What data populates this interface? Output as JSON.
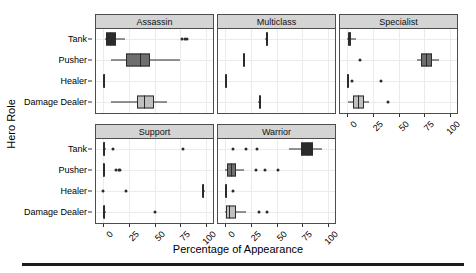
{
  "chart_data": {
    "type": "box",
    "title": "",
    "xlabel": "Percentage of Appearance",
    "ylabel": "Hero Role",
    "xlim": [
      -4,
      104
    ],
    "xticks": [
      0,
      25,
      50,
      75,
      100
    ],
    "xtick_labels": [
      "0",
      "25",
      "50",
      "75",
      "100"
    ],
    "categories": [
      "Tank",
      "Pusher",
      "Healer",
      "Damage Dealer"
    ],
    "grid": true,
    "legend": "none",
    "facet_variable": "Hero Class",
    "box_fill_colors": {
      "Tank": "#2b2b2b",
      "Pusher": "#6e6e6e",
      "Healer": "#2b2b2b",
      "Damage Dealer": "#c0c0c0"
    },
    "panels": [
      {
        "label": "Assassin",
        "row": 0,
        "col": 0,
        "boxes": [
          {
            "category": "Tank",
            "whisker_low": 1.5,
            "q1": 3.0,
            "median": 6.5,
            "q3": 12.5,
            "whisker_high": 21.0,
            "outliers": [
              77.0,
              79.5,
              81.5
            ]
          },
          {
            "category": "Pusher",
            "whisker_low": 8.0,
            "q1": 22.0,
            "median": 35.5,
            "q3": 46.0,
            "whisker_high": 75.0,
            "outliers": []
          },
          {
            "category": "Healer",
            "whisker_low": 0.0,
            "q1": 0.0,
            "median": 0.5,
            "q3": 1.0,
            "whisker_high": 1.5,
            "outliers": []
          },
          {
            "category": "Damage Dealer",
            "whisker_low": 8.0,
            "q1": 33.0,
            "median": 40.0,
            "q3": 49.5,
            "whisker_high": 62.0,
            "outliers": []
          }
        ]
      },
      {
        "label": "Multiclass",
        "row": 0,
        "col": 1,
        "boxes": [
          {
            "category": "Tank",
            "whisker_low": 39.0,
            "q1": 39.5,
            "median": 40.0,
            "q3": 40.5,
            "whisker_high": 41.0,
            "outliers": []
          },
          {
            "category": "Pusher",
            "whisker_low": 17.0,
            "q1": 17.5,
            "median": 18.0,
            "q3": 18.5,
            "whisker_high": 19.0,
            "outliers": []
          },
          {
            "category": "Healer",
            "whisker_low": 0.0,
            "q1": 0.0,
            "median": 0.5,
            "q3": 1.0,
            "whisker_high": 1.5,
            "outliers": []
          },
          {
            "category": "Damage Dealer",
            "whisker_low": 32.0,
            "q1": 32.5,
            "median": 33.0,
            "q3": 33.5,
            "whisker_high": 34.0,
            "outliers": []
          }
        ]
      },
      {
        "label": "Specialist",
        "row": 0,
        "col": 2,
        "boxes": [
          {
            "category": "Tank",
            "whisker_low": 0.0,
            "q1": 0.5,
            "median": 2.0,
            "q3": 4.0,
            "whisker_high": 8.5,
            "outliers": []
          },
          {
            "category": "Pusher",
            "whisker_low": 68.0,
            "q1": 72.0,
            "median": 77.0,
            "q3": 83.0,
            "whisker_high": 89.0,
            "outliers": [
              13.0
            ]
          },
          {
            "category": "Healer",
            "whisker_low": 0.0,
            "q1": 0.0,
            "median": 0.3,
            "q3": 0.6,
            "whisker_high": 1.0,
            "outliers": [
              5.0,
              33.0
            ]
          },
          {
            "category": "Damage Dealer",
            "whisker_low": 1.0,
            "q1": 5.5,
            "median": 11.0,
            "q3": 16.5,
            "whisker_high": 21.5,
            "outliers": [
              40.0
            ]
          }
        ]
      },
      {
        "label": "Support",
        "row": 1,
        "col": 0,
        "boxes": [
          {
            "category": "Tank",
            "whisker_low": 0.0,
            "q1": 0.0,
            "median": 0.5,
            "q3": 1.5,
            "whisker_high": 2.5,
            "outliers": [
              10.0,
              78.0
            ]
          },
          {
            "category": "Pusher",
            "whisker_low": 0.0,
            "q1": 0.0,
            "median": 0.3,
            "q3": 0.8,
            "whisker_high": 1.2,
            "outliers": [
              13.0,
              15.0,
              16.5
            ]
          },
          {
            "category": "Healer",
            "whisker_low": 96.0,
            "q1": 96.5,
            "median": 97.5,
            "q3": 98.5,
            "whisker_high": 99.5,
            "outliers": [
              0.0,
              22.0
            ]
          },
          {
            "category": "Damage Dealer",
            "whisker_low": 0.0,
            "q1": 0.0,
            "median": 0.5,
            "q3": 1.5,
            "whisker_high": 2.5,
            "outliers": [
              50.0
            ]
          }
        ]
      },
      {
        "label": "Warrior",
        "row": 1,
        "col": 1,
        "boxes": [
          {
            "category": "Tank",
            "whisker_low": 62.0,
            "q1": 74.0,
            "median": 80.0,
            "q3": 86.0,
            "whisker_high": 94.0,
            "outliers": [
              8.0,
              20.0,
              31.0
            ]
          },
          {
            "category": "Pusher",
            "whisker_low": 0.0,
            "q1": 2.0,
            "median": 6.0,
            "q3": 10.5,
            "whisker_high": 18.0,
            "outliers": [
              30.0,
              39.0,
              51.0
            ]
          },
          {
            "category": "Healer",
            "whisker_low": 0.0,
            "q1": 0.0,
            "median": 0.5,
            "q3": 1.0,
            "whisker_high": 1.5,
            "outliers": [
              8.0
            ]
          },
          {
            "category": "Damage Dealer",
            "whisker_low": 0.0,
            "q1": 1.0,
            "median": 4.0,
            "q3": 11.0,
            "whisker_high": 20.5,
            "outliers": [
              33.0,
              41.0
            ]
          }
        ]
      }
    ]
  }
}
